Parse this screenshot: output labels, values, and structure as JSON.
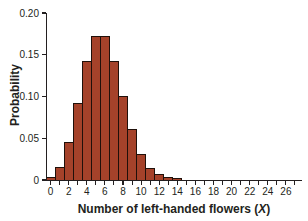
{
  "chart_data": {
    "type": "bar",
    "subtype": "probability-histogram",
    "xlabel_prefix": "Number of left-handed flowers (",
    "xlabel_var": "X",
    "xlabel_suffix": ")",
    "ylabel": "Probability",
    "x": [
      0,
      1,
      2,
      3,
      4,
      5,
      6,
      7,
      8,
      9,
      10,
      11,
      12,
      13,
      14
    ],
    "values": [
      0.004,
      0.016,
      0.046,
      0.092,
      0.142,
      0.172,
      0.172,
      0.143,
      0.101,
      0.061,
      0.031,
      0.014,
      0.007,
      0.004,
      0.002
    ],
    "xlim": [
      -0.5,
      27.8
    ],
    "ylim": [
      0,
      0.2
    ],
    "x_tick_labels": [
      "0",
      "2",
      "4",
      "6",
      "8",
      "10",
      "12",
      "14",
      "16",
      "18",
      "20",
      "22",
      "24",
      "26"
    ],
    "x_tick_label_values": [
      0,
      2,
      4,
      6,
      8,
      10,
      12,
      14,
      16,
      18,
      20,
      22,
      24,
      26
    ],
    "x_minor_tick_every": 1,
    "x_minor_tick_max": 27,
    "y_ticks": [
      {
        "label": "0.20",
        "value": 0.2
      },
      {
        "label": "0.15",
        "value": 0.15
      },
      {
        "label": "0.10",
        "value": 0.1
      },
      {
        "label": "0.05",
        "value": 0.05
      },
      {
        "label": "0",
        "value": 0
      }
    ],
    "grid": "off",
    "legend": "none",
    "bar_fill": "#a5422a",
    "bar_border": "#20100a",
    "axis_color": "#231f20"
  }
}
